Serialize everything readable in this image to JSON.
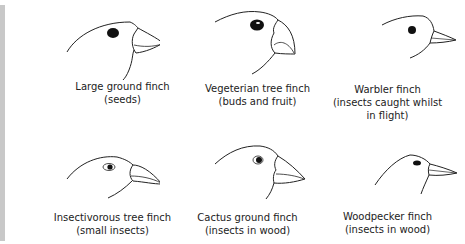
{
  "diagram": {
    "finches": [
      {
        "name": "Large ground finch",
        "diet": "(seeds)"
      },
      {
        "name": "Vegeterian tree finch",
        "diet": "(buds and fruit)"
      },
      {
        "name": "Warbler finch",
        "diet": "(insects caught whilst",
        "diet2": "in flight)"
      },
      {
        "name": "Insectivorous tree finch",
        "diet": "(small insects)"
      },
      {
        "name": "Cactus ground finch",
        "diet": "(insects in wood)"
      },
      {
        "name": "Woodpecker finch",
        "diet": "(insects in wood)"
      }
    ]
  }
}
